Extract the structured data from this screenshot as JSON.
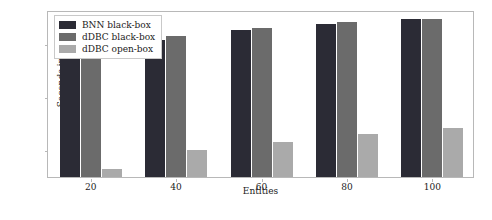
{
  "chart_data": {
    "type": "bar",
    "title": "",
    "xlabel": "Entities",
    "ylabel": "Seconds in log scale",
    "categories": [
      "20",
      "40",
      "60",
      "80",
      "100"
    ],
    "series": [
      {
        "name": "BNN black-box",
        "color": "#2b2b35",
        "values": [
          5500,
          11500,
          17500,
          23000,
          28000
        ]
      },
      {
        "name": "dDBC black-box",
        "color": "#6b6b6b",
        "values": [
          6200,
          13500,
          19500,
          25000,
          29000
        ]
      },
      {
        "name": "dDBC open-box",
        "color": "#aaaaaa",
        "values": [
          42,
          95,
          140,
          190,
          250
        ]
      }
    ],
    "yscale": "log",
    "ylim": [
      30,
      42000
    ],
    "yticks": [
      100,
      1000,
      10000
    ],
    "ytick_labels": [
      "10",
      "10",
      "10"
    ],
    "ytick_exponents": [
      "2",
      "3",
      "4"
    ],
    "grid": false,
    "legend_position": "upper left"
  }
}
